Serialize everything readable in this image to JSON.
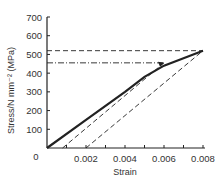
{
  "chart_data": {
    "type": "line",
    "title": "",
    "xlabel": "Strain",
    "ylabel": "Stress/N mm⁻² (MPa)",
    "xlim": [
      0,
      0.008
    ],
    "ylim": [
      0,
      700
    ],
    "x_ticks": [
      "0.002",
      "0.004",
      "0.006",
      "0.008"
    ],
    "y_ticks": [
      "0",
      "100",
      "200",
      "300",
      "400",
      "500",
      "600",
      "700"
    ],
    "origin_label": "0",
    "series": [
      {
        "name": "stress-strain curve",
        "style": "solid-bold",
        "x": [
          0,
          0.002,
          0.004,
          0.005,
          0.006,
          0.007,
          0.008
        ],
        "y": [
          0,
          150,
          300,
          380,
          440,
          480,
          520
        ]
      },
      {
        "name": "unloading line 1",
        "style": "dashed",
        "x": [
          0.0008,
          0.006
        ],
        "y": [
          0,
          455
        ]
      },
      {
        "name": "unloading line 2",
        "style": "dashed",
        "x": [
          0.002,
          0.008
        ],
        "y": [
          0,
          520
        ]
      },
      {
        "name": "horizontal ref 520",
        "style": "dashed",
        "x": [
          0,
          0.008
        ],
        "y": [
          520,
          520
        ]
      },
      {
        "name": "horizontal ref 455",
        "style": "dash-dot",
        "x": [
          0,
          0.006
        ],
        "y": [
          455,
          455
        ]
      }
    ],
    "grid": false,
    "legend": "none"
  }
}
